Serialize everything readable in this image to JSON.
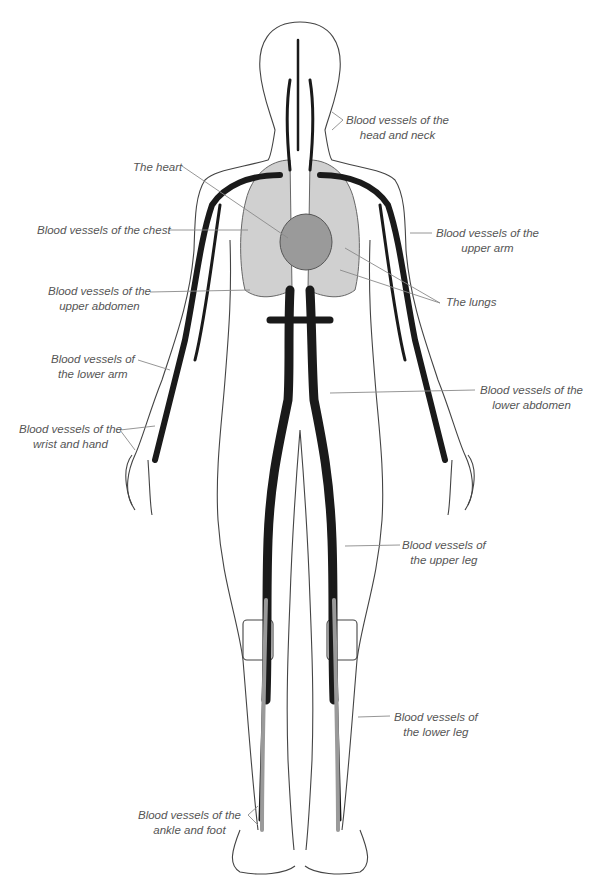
{
  "diagram": {
    "colors": {
      "vessel": "#1a1a1a",
      "vein_light": "#9a9a9a",
      "organ_fill": "#c8c8c8",
      "outline": "#444444",
      "leader": "#8a8a8a",
      "label_text": "#555555"
    },
    "labels": [
      {
        "id": "head-neck",
        "line1": "Blood vessels of the",
        "line2": "head and neck"
      },
      {
        "id": "heart",
        "line1": "The heart",
        "line2": ""
      },
      {
        "id": "chest",
        "line1": "Blood vessels of the chest",
        "line2": ""
      },
      {
        "id": "upper-arm",
        "line1": "Blood vessels of the",
        "line2": "upper arm"
      },
      {
        "id": "upper-abdomen",
        "line1": "Blood vessels of the",
        "line2": "upper abdomen"
      },
      {
        "id": "lungs",
        "line1": "The lungs",
        "line2": ""
      },
      {
        "id": "lower-arm",
        "line1": "Blood vessels of",
        "line2": "the lower arm"
      },
      {
        "id": "lower-abdomen",
        "line1": "Blood vessels of the",
        "line2": "lower abdomen"
      },
      {
        "id": "wrist-hand",
        "line1": "Blood vessels of the",
        "line2": "wrist and hand"
      },
      {
        "id": "upper-leg",
        "line1": "Blood vessels of",
        "line2": "the upper leg"
      },
      {
        "id": "lower-leg",
        "line1": "Blood vessels of",
        "line2": "the lower leg"
      },
      {
        "id": "ankle-foot",
        "line1": "Blood vessels of the",
        "line2": "ankle and foot"
      }
    ]
  }
}
